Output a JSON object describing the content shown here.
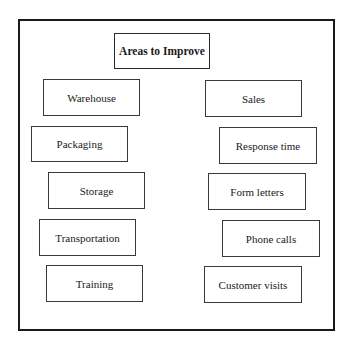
{
  "diagram": {
    "title": "Areas to Improve",
    "left_column": [
      {
        "label": "Warehouse"
      },
      {
        "label": "Packaging"
      },
      {
        "label": "Storage"
      },
      {
        "label": "Transportation"
      },
      {
        "label": "Training"
      }
    ],
    "right_column": [
      {
        "label": "Sales"
      },
      {
        "label": "Response time"
      },
      {
        "label": "Form letters"
      },
      {
        "label": "Phone calls"
      },
      {
        "label": "Customer visits"
      }
    ],
    "colors": {
      "border": "#1a1a1a",
      "background": "#ffffff",
      "text": "#1a1a1a"
    }
  }
}
